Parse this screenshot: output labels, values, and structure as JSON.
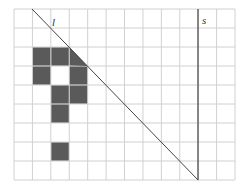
{
  "diagram": {
    "grid": {
      "cols": 12,
      "rows": 9,
      "left": 14,
      "top": 9,
      "cell_w": 18.42,
      "cell_h": 19,
      "line_color": "#d0d0d0"
    },
    "filled_cells": [
      {
        "col": 1,
        "row": 2
      },
      {
        "col": 2,
        "row": 2
      },
      {
        "col": 1,
        "row": 3
      },
      {
        "col": 3,
        "row": 3
      },
      {
        "col": 2,
        "row": 4
      },
      {
        "col": 3,
        "row": 4
      },
      {
        "col": 2,
        "row": 5
      },
      {
        "col": 2,
        "row": 7
      }
    ],
    "partial_cell": {
      "col": 3,
      "row": 2,
      "shape": "triangle-below-line"
    },
    "fill_color": "#5a5a5a",
    "lines": [
      {
        "name": "l",
        "label": "l",
        "x1": 32,
        "y1": 9,
        "x2": 198,
        "y2": 180
      },
      {
        "name": "s",
        "label": "s",
        "x1": 198,
        "y1": 9,
        "x2": 198,
        "y2": 180
      }
    ],
    "labels": {
      "l": "l",
      "s": "s"
    }
  }
}
